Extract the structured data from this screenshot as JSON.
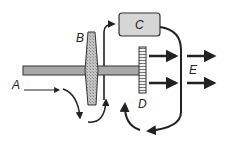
{
  "diagram": {
    "labels": {
      "a": "A",
      "b": "B",
      "c": "C",
      "d": "D",
      "e": "E"
    },
    "components": {
      "shaft": "horizontal shaft",
      "disk_b": "shaded disk B",
      "box_c": "controller box C",
      "disk_d": "striped disk D",
      "output_arrows": "output flow E"
    },
    "colors": {
      "stroke": "#222222",
      "shaft_fill": "#a8a8a8",
      "box_fill": "#d6d6d6",
      "disk_b_fill": "#b0b0b0",
      "background": "#ffffff"
    }
  }
}
